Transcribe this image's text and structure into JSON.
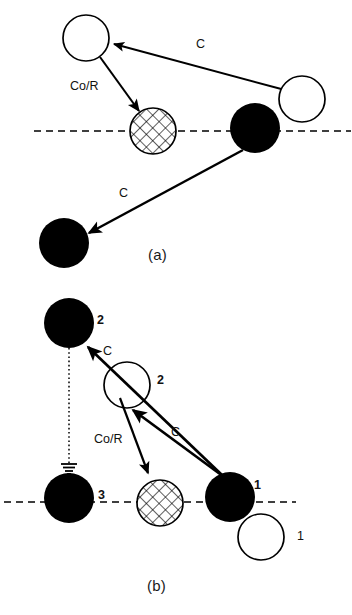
{
  "figure": {
    "type": "schematic-diagram",
    "background": "#ffffff",
    "ink_color": "#000000",
    "width": 352,
    "height": 615,
    "panels": [
      {
        "id": "a",
        "caption": "(a)",
        "caption_pos": [
          148,
          246
        ],
        "surface_line": {
          "name": "surface-dashed-line",
          "style": "dashed",
          "x1": 34,
          "y1": 131,
          "x2": 351,
          "y2": 131,
          "dash": "7 5",
          "width": 1.6
        },
        "nodes": [
          {
            "name": "open-circle-top-left",
            "fill": "white",
            "cx": 86,
            "cy": 38,
            "r": 23,
            "label": ""
          },
          {
            "name": "open-circle-right",
            "fill": "white",
            "cx": 302,
            "cy": 99,
            "r": 23,
            "label": ""
          },
          {
            "name": "hatched-circle",
            "fill": "crosshatch",
            "cx": 153,
            "cy": 131,
            "r": 23,
            "label": ""
          },
          {
            "name": "filled-circle-surface",
            "fill": "black",
            "cx": 255,
            "cy": 128,
            "r": 25,
            "label": ""
          },
          {
            "name": "filled-circle-bottom",
            "fill": "black",
            "cx": 64,
            "cy": 243,
            "r": 25,
            "label": ""
          }
        ],
        "arrows": [
          {
            "name": "arrow-c-upper",
            "label": "C",
            "label_pos": [
              196,
              44
            ],
            "x1": 285,
            "y1": 90,
            "x2": 112,
            "y2": 44,
            "width": 1.9
          },
          {
            "name": "arrow-co-r",
            "label": "Co/R",
            "label_pos": [
              72,
              86
            ],
            "x1": 100,
            "y1": 57,
            "x2": 141,
            "y2": 113,
            "width": 2.1
          },
          {
            "name": "arrow-c-lower",
            "label": "C",
            "label_pos": [
              121,
              192
            ],
            "x1": 243,
            "y1": 150,
            "x2": 86,
            "y2": 234,
            "width": 2.4
          }
        ]
      },
      {
        "id": "b",
        "caption": "(b)",
        "caption_pos": [
          147,
          577
        ],
        "surface_line": {
          "name": "surface-dashed-line",
          "style": "dashed",
          "x1": 4,
          "y1": 502,
          "x2": 296,
          "y2": 502,
          "dash": "7 5",
          "width": 1.6
        },
        "nodes": [
          {
            "name": "filled-circle-2-top",
            "fill": "black",
            "cx": 69,
            "cy": 323,
            "r": 25,
            "label": "2",
            "label_pos": [
              98,
              315
            ],
            "bold": true
          },
          {
            "name": "open-circle-2",
            "fill": "white",
            "cx": 127,
            "cy": 385,
            "r": 23,
            "label": "2",
            "label_pos": [
              158,
              376
            ],
            "bold": true
          },
          {
            "name": "filled-circle-3",
            "fill": "black",
            "cx": 69,
            "cy": 498,
            "r": 25,
            "label": "3",
            "label_pos": [
              99,
              490
            ],
            "bold": true
          },
          {
            "name": "hatched-circle",
            "fill": "crosshatch",
            "cx": 160,
            "cy": 503,
            "r": 23,
            "label": ""
          },
          {
            "name": "filled-circle-1-surface",
            "fill": "black",
            "cx": 230,
            "cy": 497,
            "r": 25,
            "label": "1",
            "label_pos": [
              254,
              482
            ],
            "bold": true
          },
          {
            "name": "open-circle-1-lower",
            "fill": "white",
            "cx": 261,
            "cy": 537,
            "r": 23,
            "label": "1",
            "label_pos": [
              298,
              535
            ],
            "bold": false
          }
        ],
        "arrows": [
          {
            "name": "arrow-c-upper",
            "label": "C",
            "label_pos": [
              105,
              348
            ],
            "x1": 222,
            "y1": 475,
            "x2": 86,
            "y2": 345,
            "width": 2.6
          },
          {
            "name": "arrow-c-mid",
            "label": "C",
            "label_pos": [
              172,
              430
            ],
            "x1": 222,
            "y1": 475,
            "x2": 130,
            "y2": 407,
            "width": 2.6
          },
          {
            "name": "arrow-co-r",
            "label": "Co/R",
            "label_pos": [
              96,
              438
            ],
            "x1": 120,
            "y1": 398,
            "x2": 150,
            "y2": 475,
            "width": 2.1
          }
        ],
        "dotted_connector": {
          "name": "dotted-vertical-connector",
          "x1": 69,
          "y1": 348,
          "x2": 69,
          "y2": 463,
          "dash": "1.6 2.6",
          "width": 1.4,
          "terminator": "ground-arrow-symbol"
        }
      }
    ]
  },
  "labels": {
    "c": "C",
    "co_r": "Co/R",
    "one": "1",
    "two": "2",
    "three": "3",
    "caption_a": "(a)",
    "caption_b": "(b)"
  }
}
